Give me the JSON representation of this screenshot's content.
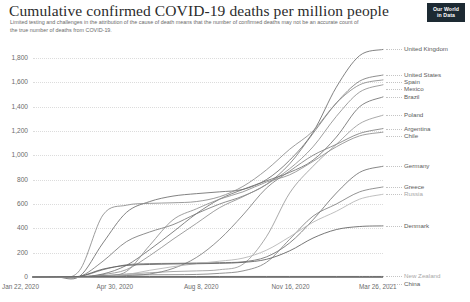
{
  "header": {
    "title": "Cumulative confirmed COVID-19 deaths per million people",
    "subtitle": "Limited testing and challenges in the attribution of the cause of death means that the number of confirmed deaths may not be an accurate count of the true number of deaths from COVID-19.",
    "logo_line1": "Our World",
    "logo_line2": "in Data"
  },
  "chart_data": {
    "type": "line",
    "title": "Cumulative confirmed COVID-19 deaths per million people",
    "subtitle": "Limited testing and challenges in the attribution of the cause of death means that the number of confirmed deaths may not be an accurate count of the true number of deaths from COVID-19.",
    "xlabel": "",
    "ylabel": "",
    "ylim": [
      0,
      1800
    ],
    "grid": true,
    "legend_position": "right-endpoint-labels",
    "yticks": [
      "0",
      "200",
      "400",
      "600",
      "800",
      "1,000",
      "1,200",
      "1,400",
      "1,600",
      "1,800"
    ],
    "ytick_values": [
      0,
      200,
      400,
      600,
      800,
      1000,
      1200,
      1400,
      1600,
      1800
    ],
    "xticks": [
      "Jan 22, 2020",
      "Apr 30, 2020",
      "Aug 8, 2020",
      "Nov 16, 2020",
      "Mar 26, 2021"
    ],
    "x": [
      "2020-01-22",
      "2020-02-21",
      "2020-03-22",
      "2020-04-21",
      "2020-05-21",
      "2020-06-20",
      "2020-07-20",
      "2020-08-19",
      "2020-09-18",
      "2020-10-18",
      "2020-11-17",
      "2020-12-17",
      "2021-01-16",
      "2021-02-15",
      "2021-03-17",
      "2021-03-26"
    ],
    "series": [
      {
        "name": "United Kingdom",
        "color": "#6b6b6b",
        "final_value": 1870,
        "values": [
          0,
          0,
          6,
          280,
          530,
          620,
          665,
          685,
          700,
          720,
          800,
          960,
          1190,
          1560,
          1820,
          1870
        ]
      },
      {
        "name": "United States",
        "color": "#7a7a7a",
        "final_value": 1660,
        "values": [
          0,
          0,
          3,
          130,
          290,
          370,
          430,
          520,
          600,
          665,
          760,
          930,
          1180,
          1430,
          1610,
          1660
        ]
      },
      {
        "name": "Spain",
        "color": "#8a8a8a",
        "final_value": 1620,
        "values": [
          0,
          0,
          55,
          510,
          590,
          605,
          610,
          620,
          660,
          745,
          880,
          1050,
          1200,
          1430,
          1580,
          1620
        ]
      },
      {
        "name": "Mexico",
        "color": "#8f8f8f",
        "final_value": 1580,
        "values": [
          0,
          0,
          0,
          20,
          60,
          175,
          310,
          440,
          570,
          660,
          760,
          890,
          1070,
          1320,
          1520,
          1580
        ]
      },
      {
        "name": "Brazil",
        "color": "#6f6f6f",
        "final_value": 1480,
        "values": [
          0,
          0,
          1,
          25,
          95,
          225,
          370,
          520,
          640,
          720,
          790,
          860,
          960,
          1150,
          1400,
          1480
        ]
      },
      {
        "name": "Poland",
        "color": "#9a9a9a",
        "final_value": 1330,
        "values": [
          0,
          0,
          0,
          10,
          25,
          35,
          45,
          50,
          60,
          105,
          330,
          690,
          910,
          1090,
          1260,
          1330
        ]
      },
      {
        "name": "Argentina",
        "color": "#7d7d7d",
        "final_value": 1220,
        "values": [
          0,
          0,
          0,
          5,
          12,
          25,
          70,
          160,
          310,
          510,
          730,
          870,
          1000,
          1090,
          1180,
          1220
        ]
      },
      {
        "name": "Chile",
        "color": "#8c8c8c",
        "final_value": 1190,
        "values": [
          0,
          0,
          0,
          10,
          45,
          260,
          470,
          560,
          640,
          700,
          780,
          840,
          950,
          1070,
          1160,
          1190
        ]
      },
      {
        "name": "Germany",
        "color": "#707070",
        "final_value": 910,
        "values": [
          0,
          0,
          3,
          60,
          100,
          110,
          112,
          115,
          118,
          125,
          165,
          280,
          470,
          690,
          860,
          910
        ]
      },
      {
        "name": "Greece",
        "color": "#7f7f7f",
        "final_value": 740,
        "values": [
          0,
          0,
          1,
          11,
          16,
          18,
          19,
          21,
          30,
          50,
          120,
          310,
          500,
          600,
          700,
          740
        ]
      },
      {
        "name": "Russia",
        "color": "#b4b4b4",
        "final_value": 680,
        "values": [
          0,
          0,
          0,
          5,
          20,
          55,
          85,
          110,
          130,
          155,
          220,
          330,
          450,
          540,
          640,
          680
        ]
      },
      {
        "name": "Denmark",
        "color": "#5f5f5f",
        "final_value": 420,
        "values": [
          0,
          0,
          6,
          65,
          95,
          103,
          107,
          109,
          112,
          120,
          145,
          215,
          320,
          390,
          415,
          420
        ]
      },
      {
        "name": "New Zealand",
        "color": "#bfbfbf",
        "final_value": 5,
        "values": [
          0,
          0,
          0,
          2,
          4,
          4,
          4,
          4,
          5,
          5,
          5,
          5,
          5,
          5,
          5,
          5
        ]
      },
      {
        "name": "China",
        "color": "#4f4f4f",
        "final_value": 3,
        "values": [
          0,
          1,
          2,
          3,
          3,
          3,
          3,
          3,
          3,
          3,
          3,
          3,
          3,
          3,
          3,
          3
        ]
      }
    ]
  }
}
